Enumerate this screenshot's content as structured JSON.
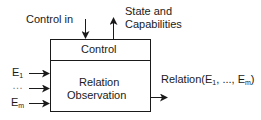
{
  "diagram": {
    "control_in_label": "Control in",
    "state_label_line1": "State and",
    "state_label_line2": "Capabilities",
    "control_section_label": "Control",
    "relation_line1": "Relation",
    "relation_line2": "Observation",
    "inputs": [
      {
        "base": "E",
        "sub": "1"
      },
      {
        "base": "…",
        "sub": ""
      },
      {
        "base": "E",
        "sub": "m"
      }
    ],
    "output": {
      "prefix": "Relation(E",
      "sub1": "1",
      "middle": ", ..., E",
      "sub2": "m",
      "suffix": ")"
    },
    "line_color": "#1a1a1a"
  }
}
